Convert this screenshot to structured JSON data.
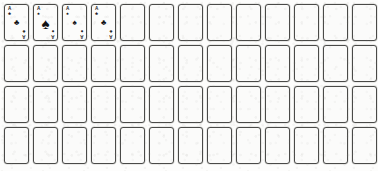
{
  "app": {
    "title": "Card Table Grid",
    "background_color": "#fdfdfc",
    "card_border_color": "#4a4a48",
    "card_face_color": "#fbfbfa",
    "pip_color": "#111114"
  },
  "grid": {
    "columns": 13,
    "rows": 4,
    "total_slots": 52,
    "filled_slots": 4,
    "empty_slots": 48,
    "card_width": 25,
    "card_height": 37,
    "column_pitch": 29,
    "row_pitch": 41
  },
  "suit_glyphs": {
    "spade": "♠",
    "heart": "♥",
    "diamond": "♦",
    "club": "♣"
  },
  "cards": [
    {
      "slot": 1,
      "row": 1,
      "column": 1,
      "state": "filled",
      "rank": "A",
      "suit": "club",
      "suit_glyph": "♣",
      "pip_size": "small",
      "label": "Ace of Clubs"
    },
    {
      "slot": 2,
      "row": 1,
      "column": 2,
      "state": "filled",
      "rank": "A",
      "suit": "spade",
      "suit_glyph": "♠",
      "pip_size": "large",
      "label": "Ace of Spades"
    },
    {
      "slot": 3,
      "row": 1,
      "column": 3,
      "state": "filled",
      "rank": "A",
      "suit": "spade",
      "suit_glyph": "♠",
      "pip_size": "small",
      "label": "Ace of Spades"
    },
    {
      "slot": 4,
      "row": 1,
      "column": 4,
      "state": "filled",
      "rank": "A",
      "suit": "club",
      "suit_glyph": "♣",
      "pip_size": "small",
      "label": "Ace of Clubs"
    }
  ],
  "empty_slot_label": "Empty card slot"
}
